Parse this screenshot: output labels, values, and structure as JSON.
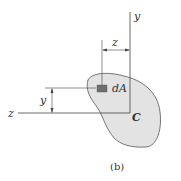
{
  "diagram": {
    "labels": {
      "y_axis": "y",
      "z_axis": "z",
      "z_dimension": "z",
      "y_dimension": "y",
      "area_element": "dA",
      "centroid": "C"
    },
    "caption": "(b)",
    "colors": {
      "shape_fill": "#e3e3e3",
      "shape_stroke": "#555555",
      "element_fill": "#6e6e6e",
      "line": "#444444"
    }
  }
}
